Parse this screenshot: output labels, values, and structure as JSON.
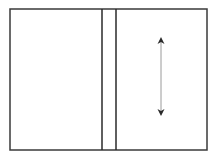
{
  "diagram": {
    "canvas": {
      "width": 218,
      "height": 162,
      "background": "#ffffff"
    },
    "frame": {
      "x": 10,
      "y": 9,
      "width": 197,
      "height": 141,
      "stroke": "#3a3a3a",
      "stroke_width": 1.5
    },
    "vertical_lines": [
      {
        "x": 102,
        "y1": 9,
        "y2": 150,
        "stroke": "#2a2a2a",
        "stroke_width": 1.5
      },
      {
        "x": 116,
        "y1": 9,
        "y2": 150,
        "stroke": "#2a2a2a",
        "stroke_width": 1.5
      }
    ],
    "arrow": {
      "type": "double-headed-vertical",
      "x": 161,
      "y1": 37,
      "y2": 116,
      "shaft_color": "#9a9a9a",
      "head_color": "#2a2a2a"
    }
  }
}
